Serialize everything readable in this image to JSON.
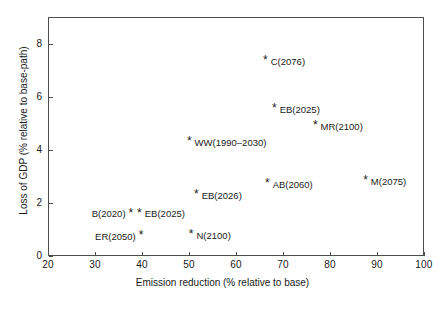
{
  "chart_data": {
    "type": "scatter",
    "title": "",
    "xlabel": "Emission reduction (% relative to base)",
    "ylabel": "Loss of GDP (% relative to base-path)",
    "xlim": [
      20,
      100
    ],
    "ylim": [
      0,
      9
    ],
    "xticks": [
      20,
      30,
      40,
      50,
      60,
      70,
      80,
      90,
      100
    ],
    "yticks": [
      0,
      2,
      4,
      6,
      8
    ],
    "grid": false,
    "legend": null,
    "marker_glyph": "*",
    "points": [
      {
        "label": "C(2076)",
        "x": 66.4,
        "y": 7.32,
        "label_side": "right"
      },
      {
        "label": "EB(2025)",
        "x": 68.3,
        "y": 5.5,
        "label_side": "right"
      },
      {
        "label": "MR(2100)",
        "x": 77.0,
        "y": 4.87,
        "label_side": "right"
      },
      {
        "label": "WW(1990–2030)",
        "x": 50.2,
        "y": 4.26,
        "label_side": "right"
      },
      {
        "label": "M(2075)",
        "x": 87.7,
        "y": 2.79,
        "label_side": "right"
      },
      {
        "label": "AB(2060)",
        "x": 66.8,
        "y": 2.68,
        "label_side": "right"
      },
      {
        "label": "EB(2026)",
        "x": 51.7,
        "y": 2.26,
        "label_side": "right"
      },
      {
        "label": "B(2020)",
        "x": 37.4,
        "y": 1.58,
        "label_side": "left"
      },
      {
        "label": "EB(2025)",
        "x": 39.6,
        "y": 1.58,
        "label_side": "right"
      },
      {
        "label": "ER(2050)",
        "x": 39.6,
        "y": 0.72,
        "label_side": "left"
      },
      {
        "label": "N(2100)",
        "x": 50.6,
        "y": 0.76,
        "label_side": "right"
      }
    ]
  },
  "colors": {
    "axis": "#4d4d4d",
    "text": "#1a1a1a",
    "background": "#ffffff"
  }
}
